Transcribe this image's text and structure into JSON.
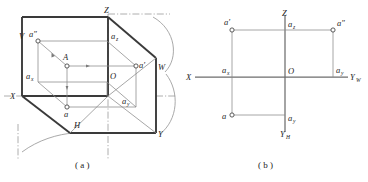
{
  "figure": {
    "caption_a": "( a )",
    "caption_b": "( b )",
    "panel_a": {
      "name": "pictorial-three-plane-projection",
      "planes": {
        "v": "V",
        "h": "H",
        "w": "W"
      },
      "axes": {
        "x": "X",
        "y": "Y",
        "z": "Z",
        "origin": "O"
      },
      "points": {
        "space_point": "A",
        "front_view": "a′",
        "top_view": "a",
        "side_view": "a″",
        "x_foot": "a",
        "x_foot_sub": "x",
        "y_foot": "a",
        "y_foot_sub": "y",
        "z_foot": "a",
        "z_foot_sub": "z"
      }
    },
    "panel_b": {
      "name": "unfolded-three-view-layout",
      "axes": {
        "x": "X",
        "z": "Z",
        "origin": "O",
        "y_w": "Y",
        "y_w_sub": "W",
        "y_h": "Y",
        "y_h_sub": "H"
      },
      "points": {
        "front_view": "a′",
        "side_view": "a″",
        "top_view": "a",
        "x_foot": "a",
        "x_foot_sub": "x",
        "y_foot_right": "a",
        "y_foot_right_sub": "y",
        "y_foot_bottom": "a",
        "y_foot_bottom_sub": "y",
        "z_foot": "a",
        "z_foot_sub": "z"
      }
    }
  },
  "colors": {
    "ink": "#242424",
    "thick_line": "#3a3a3a",
    "thin_line": "#8a8a8a",
    "axis": "#6d6d6d",
    "background": "#ffffff"
  }
}
